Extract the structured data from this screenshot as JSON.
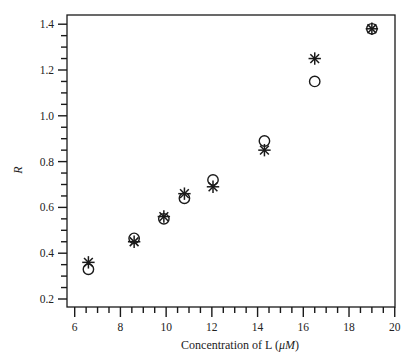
{
  "chart_data": {
    "type": "scatter",
    "title": "",
    "xlabel": "Concentration of L (μM)",
    "xlabel_prefix": "Concentration of L (",
    "xlabel_unit": "μM",
    "xlabel_suffix": ")",
    "ylabel": "R",
    "xlim": [
      5.6,
      20
    ],
    "ylim": [
      0.16,
      1.44
    ],
    "x_ticks": [
      6,
      8,
      10,
      12,
      14,
      16,
      18,
      20
    ],
    "y_ticks": [
      0.2,
      0.4,
      0.6,
      0.8,
      1.0,
      1.2,
      1.4
    ],
    "x_tick_labels": [
      "6",
      "8",
      "10",
      "12",
      "14",
      "16",
      "18",
      "20"
    ],
    "y_tick_labels": [
      "0.2",
      "0.4",
      "0.6",
      "0.8",
      "1.0",
      "1.2",
      "1.4"
    ],
    "x_minor_step": 0.5,
    "y_minor_step": 0.05,
    "grid": false,
    "legend": null,
    "series": [
      {
        "name": "circles",
        "marker": "open-circle",
        "x": [
          6.6,
          8.6,
          9.9,
          10.8,
          12.05,
          14.3,
          16.5,
          19.0
        ],
        "y": [
          0.33,
          0.465,
          0.55,
          0.64,
          0.72,
          0.89,
          1.15,
          1.38
        ]
      },
      {
        "name": "asterisks",
        "marker": "asterisk",
        "x": [
          6.6,
          8.6,
          9.9,
          10.8,
          12.05,
          14.3,
          16.5,
          19.0
        ],
        "y": [
          0.36,
          0.45,
          0.56,
          0.66,
          0.69,
          0.85,
          1.25,
          1.38
        ]
      }
    ]
  },
  "colors": {
    "ink": "#1a1a1a",
    "background": "#ffffff"
  }
}
